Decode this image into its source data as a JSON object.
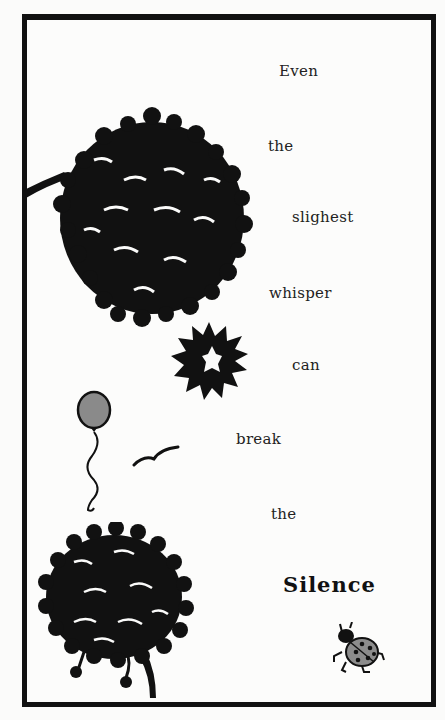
{
  "poem": {
    "lines": [
      {
        "text": "Even",
        "x": 279,
        "y": 62
      },
      {
        "text": "the",
        "x": 268,
        "y": 137
      },
      {
        "text": "slighest",
        "x": 292,
        "y": 208
      },
      {
        "text": "whisper",
        "x": 269,
        "y": 284
      },
      {
        "text": "can",
        "x": 292,
        "y": 356
      },
      {
        "text": "break",
        "x": 236,
        "y": 430
      },
      {
        "text": "the",
        "x": 271,
        "y": 505
      },
      {
        "text": "Silence",
        "x": 283,
        "y": 572
      },
      {
        "text": ".",
        "x": 364,
        "y": 576
      }
    ]
  },
  "illustrations": {
    "tree_top": "dense black tree canopy with branch from left edge",
    "sun": "black spiky sun shape",
    "balloon": {
      "label": "balloon",
      "color": "#8a8a8a"
    },
    "bird": "flying bird silhouette",
    "tree_bottom": "black tree canopy with trunk",
    "ladybug": {
      "label": "ladybug",
      "color": "#8c8c8c"
    }
  },
  "colors": {
    "ink": "#111111",
    "paper": "#fbfbfa"
  }
}
